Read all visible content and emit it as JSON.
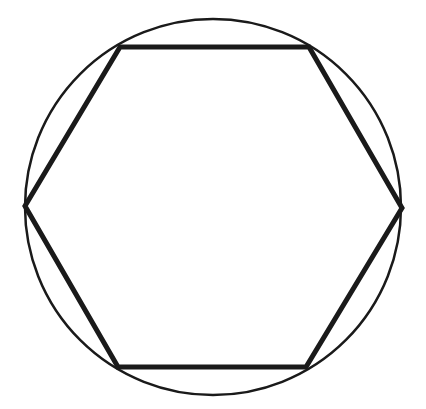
{
  "figure": {
    "background": "#ffffff",
    "stroke_color": "#1a1a1a",
    "circle": {
      "cx": 213,
      "cy": 207,
      "r": 188,
      "stroke_width": 2.5
    },
    "hexagon": {
      "stroke_width": 5,
      "vertices": [
        [
          120,
          47
        ],
        [
          309,
          47
        ],
        [
          402,
          208
        ],
        [
          306,
          367
        ],
        [
          118,
          367
        ],
        [
          25,
          206
        ]
      ]
    }
  }
}
